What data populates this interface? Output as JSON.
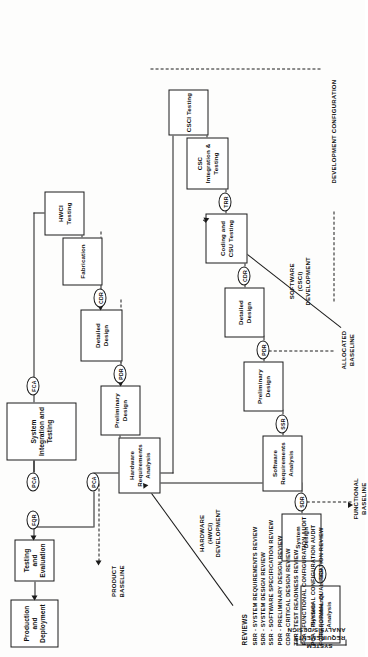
{
  "diagram": {
    "orientation": "rotated-90"
  },
  "legend": {
    "title": "REVIEWS",
    "entries": [
      {
        "code": "SRR",
        "text": "SRR - SYSTEM REQUIREMENTS REVIEW"
      },
      {
        "code": "SDR",
        "text": "SDR - SYSTEM DESIGN REVIEW"
      },
      {
        "code": "SSR",
        "text": "SSR - SOFTWARE SPECIFICATION REVIEW"
      },
      {
        "code": "PDR",
        "text": "PDR - PRELIMINARY DESIGN REVIEW"
      },
      {
        "code": "CDR",
        "text": "CDR - CRITICAL DESIGN REVIEW"
      },
      {
        "code": "TRR",
        "text": "TRR - TEST READINESS REVIEW"
      },
      {
        "code": "FCA",
        "text": "FCA - FUNCTIONAL CONFIGURATION AUDIT"
      },
      {
        "code": "PCA",
        "text": "PCA - PHYSICAL CONFIGURATION AUDIT"
      },
      {
        "code": "FQR",
        "text": "FQR - FORMAL QUALIFICATION REVIEW"
      }
    ]
  },
  "boxes": {
    "production_deployment": "Production and Deployment",
    "testing_evaluation": "Testing and Evaluation",
    "system_integration_testing": "System Integration and Testing",
    "hwci_testing": "HWCI Testing",
    "fabrication": "Fabrication",
    "hw_detailed_design": "Detailed Design",
    "hw_preliminary_design": "Preliminary Design",
    "hw_requirements_analysis": "Hardware Requirements Analysis",
    "csc_integration_testing": "CSC Integration & Testing",
    "csci_testing": "CSCI Testing",
    "coding_csu_testing": "Coding and CSU Testing",
    "sw_detailed_design": "Detailed Design",
    "sw_preliminary_design": "Preliminary Design",
    "sw_requirements_analysis": "Software Requirements Analysis",
    "system_design": "System Design",
    "system_requirements_analysis": "System Requirements Analysis"
  },
  "reviews": {
    "fqr": "FQR",
    "pca_1": "PCA",
    "pca_2": "PCA",
    "fca": "FCA",
    "cdr_hw": "CDR",
    "trr": "TRR",
    "cdr_sw": "CDR",
    "pdr_hw": "PDR",
    "pdr_sw": "PDR",
    "ssr": "SSR",
    "sdr": "SDR",
    "srr": "SRR"
  },
  "labels": {
    "hardware_development": "HARDWARE\n(HWCI)\nDEVELOPMENT",
    "software_development": "SOFTWARE\n(CSCI)\nDEVELOPMENT",
    "system_requirements": "SYSTEM\nREQUIREMENTS\nANALYSIS/DESIGN",
    "development_configuration": "DEVELOPMENT CONFIGURATION",
    "product_baseline": "PRODUCT\nBASELINE",
    "allocated_baseline": "ALLOCATED\nBASELINE",
    "functional_baseline": "FUNCTIONAL\nBASELINE"
  },
  "colors": {
    "ink": "#1a1a1a",
    "paper": "#ffffff",
    "page": "#fdfdfc"
  }
}
